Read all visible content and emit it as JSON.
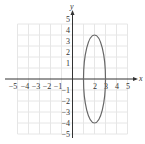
{
  "chart_data": {
    "type": "line",
    "title": "",
    "xlabel": "x",
    "ylabel": "y",
    "xlim": [
      -5,
      5
    ],
    "ylim": [
      -5,
      5
    ],
    "grid": true,
    "x_ticks": [
      "−5",
      "−4",
      "−3",
      "−2",
      "−1",
      "2",
      "3",
      "4",
      "5"
    ],
    "y_ticks": [
      "5",
      "4",
      "3",
      "2",
      "1",
      "−1",
      "−2",
      "−3",
      "−4",
      "−5"
    ],
    "series": [
      {
        "name": "ellipse",
        "shape": "ellipse",
        "center": [
          2,
          0
        ],
        "semi_axis_x": 1,
        "semi_axis_y": 4,
        "equation": "(x-2)^2/1 + y^2/16 = 1",
        "color": "#666666"
      }
    ]
  },
  "labels": {
    "x_axis": "x",
    "y_axis": "y",
    "x_ticks": {
      "m5": "−5",
      "m4": "−4",
      "m3": "−3",
      "m2": "−2",
      "m1": "−1",
      "p2": "2",
      "p3": "3",
      "p4": "4",
      "p5": "5"
    },
    "y_ticks": {
      "p5": "5",
      "p4": "4",
      "p3": "3",
      "p2": "2",
      "p1": "1",
      "m1": "−1",
      "m2": "−2",
      "m3": "−3",
      "m4": "−4",
      "m5": "−5"
    }
  }
}
